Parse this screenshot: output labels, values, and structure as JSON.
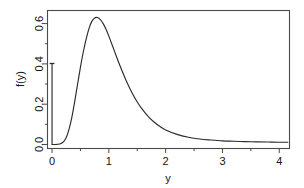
{
  "chart_data": {
    "type": "line",
    "title": "",
    "subtitle": "",
    "xlabel": "y",
    "ylabel": "f(y)",
    "xlim": [
      -0.08,
      4.18
    ],
    "ylim": [
      -0.02,
      0.665
    ],
    "grid": false,
    "legend": null,
    "x_ticks": [
      {
        "value": 0,
        "label": "0"
      },
      {
        "value": 1,
        "label": "1"
      },
      {
        "value": 2,
        "label": "2"
      },
      {
        "value": 3,
        "label": "3"
      },
      {
        "value": 4,
        "label": "4"
      }
    ],
    "x_minor_ticks": [
      0.5,
      1.5,
      2.5,
      3.5
    ],
    "y_ticks": [
      {
        "value": 0.0,
        "label": "0.0"
      },
      {
        "value": 0.2,
        "label": "0.2"
      },
      {
        "value": 0.4,
        "label": "0.4"
      },
      {
        "value": 0.6,
        "label": "0.6"
      }
    ],
    "y_minor_ticks": [
      0.1,
      0.3,
      0.5
    ],
    "series": [
      {
        "name": "density",
        "kind": "line",
        "x": [
          0.0,
          0.05,
          0.1,
          0.15,
          0.2,
          0.25,
          0.3,
          0.35,
          0.4,
          0.45,
          0.5,
          0.55,
          0.6,
          0.65,
          0.7,
          0.75,
          0.8,
          0.85,
          0.9,
          0.95,
          1.0,
          1.1,
          1.2,
          1.3,
          1.4,
          1.5,
          1.6,
          1.7,
          1.8,
          1.9,
          2.0,
          2.2,
          2.4,
          2.6,
          2.8,
          3.0,
          3.2,
          3.4,
          3.6,
          3.8,
          4.0,
          4.15
        ],
        "y": [
          0.0,
          0.0,
          0.001,
          0.004,
          0.013,
          0.035,
          0.076,
          0.137,
          0.215,
          0.3,
          0.384,
          0.459,
          0.523,
          0.575,
          0.611,
          0.628,
          0.63,
          0.62,
          0.6,
          0.572,
          0.538,
          0.462,
          0.388,
          0.32,
          0.261,
          0.211,
          0.17,
          0.137,
          0.11,
          0.089,
          0.072,
          0.05,
          0.036,
          0.027,
          0.022,
          0.018,
          0.016,
          0.014,
          0.013,
          0.012,
          0.011,
          0.011
        ]
      },
      {
        "name": "point-mass-at-zero",
        "kind": "spike",
        "x": 0.0,
        "y_base": 0.0,
        "y_top": 0.402,
        "has_cap_marker": true
      }
    ],
    "peak": {
      "x": 0.78,
      "y": 0.63
    },
    "annotations": []
  },
  "figure": {
    "background_color": "#ffffff",
    "frame_color": "#4a4a4a",
    "curve_color": "#2b2b2b",
    "text_color": "#111111"
  }
}
